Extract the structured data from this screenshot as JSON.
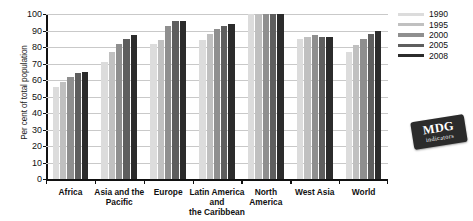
{
  "chart_data": {
    "type": "bar",
    "title": "",
    "xlabel": "",
    "ylabel": "Per cent of total population",
    "ylim": [
      0,
      100
    ],
    "yticks": [
      0,
      10,
      20,
      30,
      40,
      50,
      60,
      70,
      80,
      90,
      100
    ],
    "grid": true,
    "legend_position": "right",
    "categories": [
      "Africa",
      "Asia and the Pacific",
      "Europe",
      "Latin America and the Caribbean",
      "North America",
      "West Asia",
      "World"
    ],
    "category_label_lines": [
      [
        "Africa"
      ],
      [
        "Asia and the",
        "Pacific"
      ],
      [
        "Europe"
      ],
      [
        "Latin America",
        "and",
        "the Caribbean"
      ],
      [
        "North",
        "America"
      ],
      [
        "West Asia"
      ],
      [
        "World"
      ]
    ],
    "series": [
      {
        "name": "1990",
        "color": "#dcdcdc",
        "values": [
          56,
          71,
          82,
          84,
          100,
          85,
          77
        ]
      },
      {
        "name": "1995",
        "color": "#c0c0c0",
        "values": [
          59,
          77,
          84,
          88,
          100,
          86,
          81
        ]
      },
      {
        "name": "2000",
        "color": "#8f8f8f",
        "values": [
          62,
          82,
          93,
          91,
          100,
          87,
          85
        ]
      },
      {
        "name": "2005",
        "color": "#5e5e5e",
        "values": [
          64,
          85,
          96,
          93,
          100,
          86,
          88
        ]
      },
      {
        "name": "2008",
        "color": "#2b2b2b",
        "values": [
          65,
          87,
          96,
          94,
          100,
          86,
          90
        ]
      }
    ],
    "legend_entries": [
      "1990",
      "1995",
      "2000",
      "2005",
      "2008"
    ]
  },
  "badge": {
    "title": "MDG",
    "subtitle": "indicators"
  }
}
